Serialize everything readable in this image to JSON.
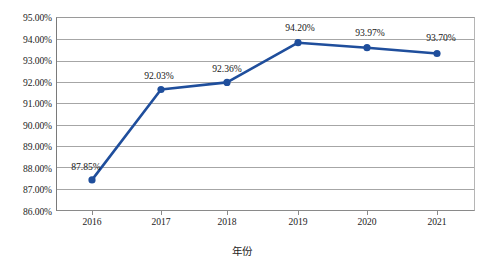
{
  "chart_data": {
    "type": "line",
    "title": "",
    "xlabel": "年份",
    "ylabel": "",
    "categories": [
      "2016",
      "2017",
      "2018",
      "2019",
      "2020",
      "2021"
    ],
    "values": [
      87.85,
      92.03,
      92.36,
      94.2,
      93.97,
      93.7
    ],
    "point_labels": [
      "87.85%",
      "92.03%",
      "92.36%",
      "94.20%",
      "93.97%",
      "93.70%"
    ],
    "ylim": [
      86.0,
      95.0
    ],
    "ytick_values": [
      95.0,
      94.0,
      93.0,
      92.0,
      91.0,
      90.0,
      89.0,
      88.0,
      87.0,
      86.0
    ],
    "ytick_labels": [
      "95.00%",
      "94.00%",
      "93.00%",
      "92.00%",
      "91.00%",
      "90.00%",
      "89.00%",
      "88.00%",
      "87.00%",
      "86.00%"
    ],
    "grid": true,
    "legend": false,
    "series_color": "#1f4e9c",
    "marker_color": "#1f4e9c",
    "gridline_color": "#a6a6a6",
    "background_color": "#ffffff",
    "text_color": "#1c1c1c"
  }
}
